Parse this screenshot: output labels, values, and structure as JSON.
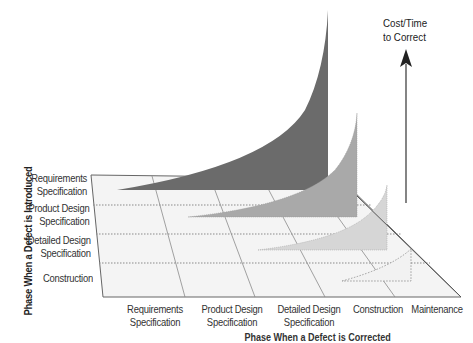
{
  "diagram": {
    "type": "3d-area-cost-of-defect",
    "y_axis_title": "Phase When a Defect is Introduced",
    "x_axis_title": "Phase When a Defect is Corrected",
    "z_axis_label": "Cost/Time to Correct",
    "rows": [
      {
        "label_line1": "Requirements",
        "label_line2": "Specification"
      },
      {
        "label_line1": "Product Design",
        "label_line2": "Specification"
      },
      {
        "label_line1": "Detailed Design",
        "label_line2": "Specification"
      },
      {
        "label_line1": "Construction",
        "label_line2": ""
      }
    ],
    "columns": [
      {
        "label_line1": "Requirements",
        "label_line2": "Specification"
      },
      {
        "label_line1": "Product Design",
        "label_line2": "Specification"
      },
      {
        "label_line1": "Detailed Design",
        "label_line2": "Specification"
      },
      {
        "label_line1": "Construction",
        "label_line2": ""
      },
      {
        "label_line1": "Maintenance",
        "label_line2": ""
      }
    ],
    "series": [
      {
        "introduced": "Requirements Specification",
        "color": "#6b6b6b",
        "style": "solid"
      },
      {
        "introduced": "Product Design Specification",
        "color": "#a9a9a9",
        "style": "solid"
      },
      {
        "introduced": "Detailed Design Specification",
        "color": "#d6d6d6",
        "style": "solid"
      },
      {
        "introduced": "Construction",
        "color": "#f2f2f2",
        "style": "dotted-outline"
      }
    ],
    "colors": {
      "plane_fill": "#f4f4f4",
      "grid_line": "#8a8a8a",
      "text": "#333333",
      "arrow": "#333333"
    }
  }
}
